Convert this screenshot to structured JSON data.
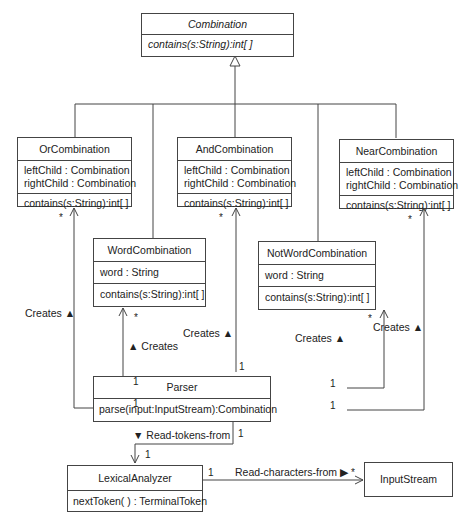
{
  "classes": {
    "combination": {
      "name": "Combination",
      "operations": [
        "contains(s:String):int[ ]"
      ]
    },
    "or": {
      "name": "OrCombination",
      "attributes": [
        "leftChild : Combination",
        "rightChild : Combination"
      ],
      "operations": [
        "contains(s:String):int[ ]"
      ]
    },
    "and": {
      "name": "AndCombination",
      "attributes": [
        "leftChild : Combination",
        "rightChild : Combination"
      ],
      "operations": [
        "contains(s:String):int[ ]"
      ]
    },
    "near": {
      "name": "NearCombination",
      "attributes": [
        "leftChild : Combination",
        "rightChild : Combination"
      ],
      "operations": [
        "contains(s:String):int[ ]"
      ]
    },
    "word": {
      "name": "WordCombination",
      "attributes": [
        "word : String"
      ],
      "operations": [
        "contains(s:String):int[ ]"
      ]
    },
    "notword": {
      "name": "NotWordCombination",
      "attributes": [
        "word : String"
      ],
      "operations": [
        "contains(s:String):int[ ]"
      ]
    },
    "parser": {
      "name": "Parser",
      "operations": [
        "parse(input:InputStream):Combination"
      ]
    },
    "lexer": {
      "name": "LexicalAnalyzer",
      "operations": [
        "nextToken( ) : TerminalToken"
      ]
    },
    "inputstream": {
      "name": "InputStream"
    }
  },
  "associations": {
    "creates_or": "Creates ▲",
    "creates_word": "▲ Creates",
    "creates_and": "Creates ▲",
    "creates_notword": "Creates ▲",
    "creates_near": "Creates ▲",
    "read_tokens": "▼ Read-tokens-from",
    "read_chars": "Read-characters-from ▶"
  },
  "multiplicity": {
    "one": "1",
    "many": "*"
  }
}
